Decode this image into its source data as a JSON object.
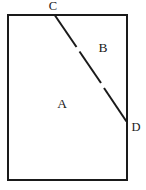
{
  "figure": {
    "background_color": "#ffffff",
    "stroke_color": "#1a1a1a",
    "label_color": "#1a1a1a",
    "rectangle": {
      "left": 8,
      "top": 15,
      "right": 127,
      "bottom": 180,
      "width": 119,
      "height": 165,
      "stroke_width": 2
    },
    "divider": {
      "name": "segment-cd",
      "from": {
        "x": 55,
        "y": 15
      },
      "to": {
        "x": 127,
        "y": 122
      },
      "stroke_width": 2,
      "style": "hand-drawn-broken"
    },
    "vertices": [
      {
        "id": "C",
        "label": "C",
        "x": 53,
        "y": 6,
        "on": "top-edge"
      },
      {
        "id": "D",
        "label": "D",
        "x": 136,
        "y": 127,
        "on": "right-edge"
      }
    ],
    "regions": [
      {
        "id": "A",
        "label": "A",
        "x": 62,
        "y": 104,
        "description": "lower-left region"
      },
      {
        "id": "B",
        "label": "B",
        "x": 103,
        "y": 48,
        "description": "upper-right region"
      }
    ]
  }
}
